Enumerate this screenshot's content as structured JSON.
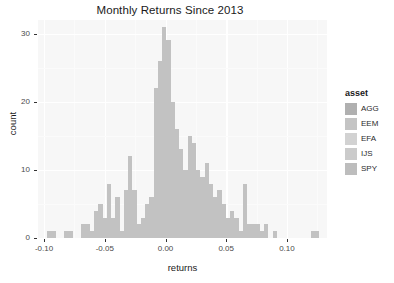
{
  "chart_data": {
    "type": "bar",
    "title": "Monthly Returns Since 2013",
    "xlabel": "returns",
    "ylabel": "count",
    "xlim": [
      -0.105,
      0.133
    ],
    "ylim": [
      0,
      32
    ],
    "grid": true,
    "legend_position": "right",
    "legend_title": "asset",
    "series_names": [
      "AGG",
      "EEM",
      "EFA",
      "IJS",
      "SPY"
    ],
    "bin_width": 0.0035,
    "note": "Stacked histogram of pooled monthly returns for five ETFs; bars are overlapping/stacked gray fills.",
    "x": [
      -0.0955,
      -0.092,
      -0.0815,
      -0.078,
      -0.0675,
      -0.064,
      -0.0605,
      -0.057,
      -0.0535,
      -0.05,
      -0.0465,
      -0.043,
      -0.0395,
      -0.036,
      -0.0325,
      -0.029,
      -0.0255,
      -0.022,
      -0.0185,
      -0.015,
      -0.0115,
      -0.008,
      -0.0045,
      -0.001,
      0.0025,
      0.006,
      0.0095,
      0.013,
      0.0165,
      0.02,
      0.0235,
      0.027,
      0.0305,
      0.034,
      0.0375,
      0.041,
      0.0445,
      0.048,
      0.0515,
      0.055,
      0.0585,
      0.062,
      0.0655,
      0.069,
      0.0725,
      0.076,
      0.0795,
      0.083,
      0.09,
      0.1215,
      0.125
    ],
    "values": [
      1,
      1,
      1,
      1,
      2,
      2,
      1,
      4,
      5,
      3,
      8,
      3,
      6,
      1,
      7,
      12,
      7,
      2,
      3,
      5,
      6,
      22,
      26,
      31,
      29,
      20,
      16,
      13,
      10,
      15,
      14,
      10,
      9,
      11,
      8,
      6,
      7,
      5,
      3,
      4,
      3,
      1,
      8,
      2,
      2,
      2,
      1,
      2,
      1,
      1,
      1
    ],
    "x_ticks": [
      -0.1,
      -0.05,
      0.0,
      0.05,
      0.1
    ],
    "x_tick_labels": [
      "-0.10",
      "-0.05",
      "0.00",
      "0.05",
      "0.10"
    ],
    "y_ticks": [
      0,
      10,
      20,
      30
    ],
    "y_tick_labels": [
      "0",
      "10",
      "20",
      "30"
    ]
  },
  "legend": {
    "title": "asset",
    "items": [
      {
        "label": "AGG",
        "color": "#b0b0b0"
      },
      {
        "label": "EEM",
        "color": "#c4c4c4"
      },
      {
        "label": "EFA",
        "color": "#d2d2d2"
      },
      {
        "label": "IJS",
        "color": "#cbcbcb"
      },
      {
        "label": "SPY",
        "color": "#bdbdbd"
      }
    ]
  },
  "colors": {
    "panel_background": "#f7f7f7",
    "gridline": "#ffffff",
    "bar_fill": "#c2c2c2",
    "axis_text": "#4a4a4a",
    "title_text": "#1a1a1a"
  }
}
